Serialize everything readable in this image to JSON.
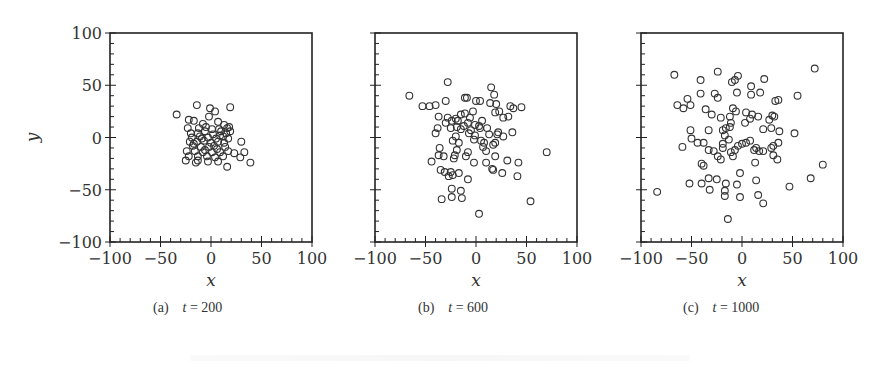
{
  "figure": {
    "subfigures": [
      {
        "tag": "(a)",
        "var": "t",
        "eq": " = 200",
        "label": "t = 200"
      },
      {
        "tag": "(b)",
        "var": "t",
        "eq": " = 600",
        "label": "t = 600"
      },
      {
        "tag": "(c)",
        "var": "t",
        "eq": " = 1000",
        "label": "t = 1000"
      }
    ],
    "xlabel": "x",
    "ylabel": "y",
    "ticks": [
      "-100",
      "-50",
      "0",
      "50",
      "100"
    ]
  },
  "chart_data": [
    {
      "type": "scatter",
      "title": "(a) t = 200",
      "xlabel": "x",
      "ylabel": "y",
      "xlim": [
        -100,
        100
      ],
      "ylim": [
        -100,
        100
      ],
      "xticks": [
        -100,
        -50,
        0,
        50,
        100
      ],
      "yticks": [
        -100,
        -50,
        0,
        50,
        100
      ],
      "grid": false,
      "marker": "open-circle",
      "points": [
        [
          -34,
          22
        ],
        [
          -14,
          31
        ],
        [
          -1,
          28
        ],
        [
          4,
          25
        ],
        [
          19,
          29
        ],
        [
          -2,
          20
        ],
        [
          -22,
          17
        ],
        [
          -17,
          16
        ],
        [
          -8,
          13
        ],
        [
          7,
          15
        ],
        [
          13,
          12
        ],
        [
          -23,
          9
        ],
        [
          -12,
          9
        ],
        [
          -5,
          10
        ],
        [
          1,
          8
        ],
        [
          8,
          8
        ],
        [
          16,
          9
        ],
        [
          -20,
          4
        ],
        [
          -13,
          4
        ],
        [
          -6,
          6
        ],
        [
          2,
          3
        ],
        [
          9,
          2
        ],
        [
          15,
          4
        ],
        [
          19,
          6
        ],
        [
          -19,
          0
        ],
        [
          -11,
          1
        ],
        [
          -3,
          0
        ],
        [
          5,
          -1
        ],
        [
          12,
          1
        ],
        [
          17,
          -1
        ],
        [
          -21,
          -4
        ],
        [
          -14,
          -4
        ],
        [
          -7,
          -3
        ],
        [
          0,
          -5
        ],
        [
          7,
          -4
        ],
        [
          13,
          -5
        ],
        [
          -18,
          -8
        ],
        [
          -10,
          -9
        ],
        [
          -2,
          -9
        ],
        [
          6,
          -11
        ],
        [
          14,
          -9
        ],
        [
          30,
          -4
        ],
        [
          -24,
          -13
        ],
        [
          -16,
          -13
        ],
        [
          -8,
          -14
        ],
        [
          1,
          -14
        ],
        [
          9,
          -14
        ],
        [
          17,
          -13
        ],
        [
          -22,
          -18
        ],
        [
          -13,
          -18
        ],
        [
          -4,
          -18
        ],
        [
          4,
          -19
        ],
        [
          12,
          -18
        ],
        [
          23,
          -15
        ],
        [
          33,
          -14
        ],
        [
          -25,
          -22
        ],
        [
          -15,
          -24
        ],
        [
          -3,
          -23
        ],
        [
          7,
          -23
        ],
        [
          29,
          -19
        ],
        [
          -13,
          -22
        ],
        [
          16,
          -28
        ],
        [
          39,
          -24
        ],
        [
          -17,
          -6
        ],
        [
          10,
          6
        ],
        [
          3,
          -8
        ],
        [
          -9,
          -1
        ],
        [
          18,
          10
        ],
        [
          -6,
          -12
        ]
      ]
    },
    {
      "type": "scatter",
      "title": "(b) t = 600",
      "xlabel": "x",
      "ylabel": "",
      "xlim": [
        -100,
        100
      ],
      "ylim": [
        -100,
        100
      ],
      "xticks": [
        -100,
        -50,
        0,
        50,
        100
      ],
      "yticks": [
        -100,
        -50,
        0,
        50,
        100
      ],
      "grid": false,
      "marker": "open-circle",
      "points": [
        [
          -28,
          53
        ],
        [
          -66,
          40
        ],
        [
          15,
          48
        ],
        [
          18,
          41
        ],
        [
          -11,
          38
        ],
        [
          -9,
          38
        ],
        [
          0,
          35
        ],
        [
          4,
          35
        ],
        [
          -30,
          35
        ],
        [
          -46,
          30
        ],
        [
          -40,
          31
        ],
        [
          -53,
          30
        ],
        [
          14,
          33
        ],
        [
          20,
          32
        ],
        [
          34,
          30
        ],
        [
          37,
          28
        ],
        [
          45,
          29
        ],
        [
          23,
          25
        ],
        [
          19,
          24
        ],
        [
          27,
          19
        ],
        [
          32,
          20
        ],
        [
          -37,
          20
        ],
        [
          -28,
          19
        ],
        [
          -20,
          18
        ],
        [
          -15,
          22
        ],
        [
          -11,
          23
        ],
        [
          -3,
          25
        ],
        [
          -6,
          19
        ],
        [
          6,
          16
        ],
        [
          -24,
          16
        ],
        [
          -18,
          16
        ],
        [
          -30,
          14
        ],
        [
          -8,
          14
        ],
        [
          -1,
          12
        ],
        [
          -12,
          11
        ],
        [
          3,
          11
        ],
        [
          -19,
          10
        ],
        [
          11,
          9
        ],
        [
          -38,
          9
        ],
        [
          -25,
          9
        ],
        [
          -15,
          8
        ],
        [
          -5,
          7
        ],
        [
          4,
          9
        ],
        [
          -40,
          4
        ],
        [
          -7,
          4
        ],
        [
          -1,
          2
        ],
        [
          13,
          3
        ],
        [
          22,
          5
        ],
        [
          27,
          1
        ],
        [
          36,
          5
        ],
        [
          21,
          3
        ],
        [
          -20,
          1
        ],
        [
          -23,
          -3
        ],
        [
          -2,
          -2
        ],
        [
          5,
          -3
        ],
        [
          19,
          -5
        ],
        [
          17,
          -7
        ],
        [
          -36,
          -10
        ],
        [
          -19,
          -12
        ],
        [
          7,
          -9
        ],
        [
          -8,
          -14
        ],
        [
          10,
          -13
        ],
        [
          -37,
          -17
        ],
        [
          -32,
          -18
        ],
        [
          -21,
          -17
        ],
        [
          -22,
          -20
        ],
        [
          -44,
          -23
        ],
        [
          -2,
          -24
        ],
        [
          10,
          -24
        ],
        [
          19,
          -18
        ],
        [
          31,
          -22
        ],
        [
          42,
          -24
        ],
        [
          -35,
          -31
        ],
        [
          -31,
          -33
        ],
        [
          -25,
          -33
        ],
        [
          -23,
          -36
        ],
        [
          -17,
          -34
        ],
        [
          -27,
          -37
        ],
        [
          17,
          -31
        ],
        [
          16,
          -30
        ],
        [
          26,
          -34
        ],
        [
          41,
          -37
        ],
        [
          -8,
          -40
        ],
        [
          70,
          -14
        ],
        [
          -24,
          -49
        ],
        [
          -15,
          -51
        ],
        [
          -34,
          -59
        ],
        [
          -24,
          -57
        ],
        [
          -14,
          -58
        ],
        [
          54,
          -61
        ],
        [
          3,
          -73
        ],
        [
          -17,
          -5
        ],
        [
          -10,
          -18
        ],
        [
          8,
          -5
        ]
      ]
    },
    {
      "type": "scatter",
      "title": "(c) t = 1000",
      "xlabel": "x",
      "ylabel": "",
      "xlim": [
        -100,
        100
      ],
      "ylim": [
        -100,
        100
      ],
      "xticks": [
        -100,
        -50,
        0,
        50,
        100
      ],
      "yticks": [
        -100,
        -50,
        0,
        50,
        100
      ],
      "grid": false,
      "marker": "open-circle",
      "points": [
        [
          -67,
          60
        ],
        [
          -24,
          63
        ],
        [
          72,
          66
        ],
        [
          -4,
          59
        ],
        [
          -7,
          55
        ],
        [
          -10,
          53
        ],
        [
          -41,
          55
        ],
        [
          22,
          56
        ],
        [
          9,
          49
        ],
        [
          -41,
          42
        ],
        [
          -5,
          43
        ],
        [
          -27,
          42
        ],
        [
          -24,
          38
        ],
        [
          9,
          41
        ],
        [
          18,
          43
        ],
        [
          55,
          40
        ],
        [
          -64,
          31
        ],
        [
          -58,
          28
        ],
        [
          -51,
          31
        ],
        [
          -54,
          37
        ],
        [
          33,
          35
        ],
        [
          36,
          36
        ],
        [
          -36,
          27
        ],
        [
          -9,
          28
        ],
        [
          -30,
          22
        ],
        [
          -21,
          19
        ],
        [
          -6,
          25
        ],
        [
          -12,
          20
        ],
        [
          4,
          24
        ],
        [
          10,
          22
        ],
        [
          16,
          20
        ],
        [
          8,
          18
        ],
        [
          27,
          17
        ],
        [
          30,
          21
        ],
        [
          32,
          20
        ],
        [
          -11,
          14
        ],
        [
          3,
          14
        ],
        [
          -16,
          9
        ],
        [
          -12,
          10
        ],
        [
          -19,
          7
        ],
        [
          29,
          9
        ],
        [
          37,
          6
        ],
        [
          21,
          8
        ],
        [
          52,
          4
        ],
        [
          -51,
          7
        ],
        [
          -33,
          7
        ],
        [
          -50,
          -1
        ],
        [
          -17,
          2
        ],
        [
          -13,
          -2
        ],
        [
          -19,
          -6
        ],
        [
          -19,
          -10
        ],
        [
          -28,
          -13
        ],
        [
          -33,
          -12
        ],
        [
          -38,
          -5
        ],
        [
          -59,
          -9
        ],
        [
          -44,
          -5
        ],
        [
          -11,
          -14
        ],
        [
          -4,
          -8
        ],
        [
          -7,
          -12
        ],
        [
          0,
          -6
        ],
        [
          4,
          -5
        ],
        [
          8,
          -3
        ],
        [
          12,
          -12
        ],
        [
          14,
          -10
        ],
        [
          17,
          -13
        ],
        [
          21,
          -13
        ],
        [
          29,
          -10
        ],
        [
          31,
          -17
        ],
        [
          35,
          -21
        ],
        [
          36,
          -5
        ],
        [
          -24,
          -18
        ],
        [
          -21,
          -21
        ],
        [
          -40,
          -25
        ],
        [
          -38,
          -27
        ],
        [
          13,
          -24
        ],
        [
          -2,
          -34
        ],
        [
          -33,
          -39
        ],
        [
          -25,
          -40
        ],
        [
          -52,
          -44
        ],
        [
          -40,
          -44
        ],
        [
          -16,
          -44
        ],
        [
          -5,
          -45
        ],
        [
          -32,
          -50
        ],
        [
          -17,
          -51
        ],
        [
          14,
          -41
        ],
        [
          47,
          -47
        ],
        [
          68,
          -39
        ],
        [
          80,
          -26
        ],
        [
          -84,
          -52
        ],
        [
          -17,
          -56
        ],
        [
          -2,
          -57
        ],
        [
          16,
          -55
        ],
        [
          21,
          -63
        ],
        [
          -14,
          -78
        ],
        [
          31,
          -8
        ],
        [
          -9,
          -18
        ]
      ]
    }
  ],
  "footer": {
    "faint_caption": "illegible faded caption line"
  }
}
